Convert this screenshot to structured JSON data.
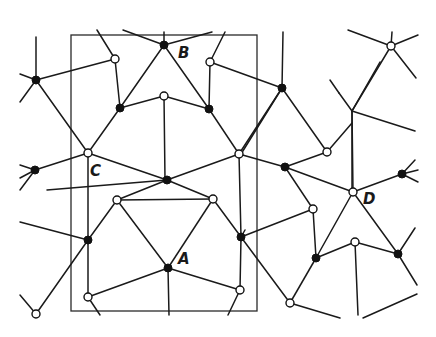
{
  "diagram": {
    "type": "crystal-lattice-network",
    "background": "#ffffff",
    "stroke_color": "#1a1a1a",
    "frame": {
      "x": 71,
      "y": 35,
      "width": 186,
      "height": 276
    },
    "labels": [
      {
        "id": "A",
        "text": "A",
        "x": 178,
        "y": 264
      },
      {
        "id": "B",
        "text": "B",
        "x": 178,
        "y": 58
      },
      {
        "id": "C",
        "text": "C",
        "x": 90,
        "y": 176
      },
      {
        "id": "D",
        "text": "D",
        "x": 363,
        "y": 204
      }
    ],
    "nodes_filled": [
      [
        36,
        80
      ],
      [
        164,
        45
      ],
      [
        120,
        108
      ],
      [
        209,
        109
      ],
      [
        282,
        88
      ],
      [
        35,
        170
      ],
      [
        167,
        180
      ],
      [
        285,
        167
      ],
      [
        402,
        174
      ],
      [
        88,
        240
      ],
      [
        241,
        237
      ],
      [
        168,
        268
      ],
      [
        316,
        258
      ],
      [
        398,
        254
      ]
    ],
    "nodes_open": [
      [
        115,
        59
      ],
      [
        210,
        62
      ],
      [
        164,
        96
      ],
      [
        391,
        46
      ],
      [
        88,
        153
      ],
      [
        239,
        154
      ],
      [
        327,
        152
      ],
      [
        117,
        200
      ],
      [
        213,
        199
      ],
      [
        313,
        209
      ],
      [
        353,
        192
      ],
      [
        355,
        242
      ],
      [
        88,
        297
      ],
      [
        240,
        290
      ],
      [
        290,
        303
      ],
      [
        36,
        314
      ]
    ],
    "edges": [
      [
        36,
        80,
        115,
        59
      ],
      [
        36,
        80,
        36,
        37
      ],
      [
        36,
        80,
        20,
        74
      ],
      [
        36,
        80,
        20,
        102
      ],
      [
        36,
        80,
        88,
        153
      ],
      [
        115,
        59,
        97,
        30
      ],
      [
        115,
        59,
        120,
        108
      ],
      [
        164,
        45,
        123,
        30
      ],
      [
        164,
        45,
        212,
        32
      ],
      [
        164,
        45,
        164,
        32
      ],
      [
        164,
        45,
        120,
        108
      ],
      [
        164,
        45,
        209,
        109
      ],
      [
        120,
        108,
        164,
        96
      ],
      [
        164,
        96,
        209,
        109
      ],
      [
        120,
        108,
        88,
        153
      ],
      [
        210,
        62,
        225,
        32
      ],
      [
        210,
        62,
        209,
        109
      ],
      [
        210,
        62,
        282,
        88
      ],
      [
        209,
        109,
        239,
        154
      ],
      [
        282,
        88,
        283,
        32
      ],
      [
        282,
        88,
        327,
        152
      ],
      [
        282,
        88,
        241,
        154
      ],
      [
        282,
        88,
        239,
        154
      ],
      [
        327,
        152,
        352,
        123
      ],
      [
        327,
        152,
        285,
        167
      ],
      [
        391,
        46,
        348,
        30
      ],
      [
        391,
        46,
        392,
        32
      ],
      [
        391,
        46,
        418,
        35
      ],
      [
        391,
        46,
        416,
        78
      ],
      [
        391,
        46,
        352,
        111
      ],
      [
        352,
        111,
        380,
        62
      ],
      [
        352,
        111,
        352,
        192
      ],
      [
        352,
        111,
        415,
        131
      ],
      [
        352,
        111,
        339,
        93
      ],
      [
        339,
        93,
        330,
        80
      ],
      [
        88,
        153,
        35,
        170
      ],
      [
        35,
        170,
        20,
        165
      ],
      [
        35,
        170,
        20,
        178
      ],
      [
        35,
        170,
        20,
        190
      ],
      [
        88,
        153,
        167,
        180
      ],
      [
        88,
        153,
        88,
        240
      ],
      [
        164,
        96,
        165,
        180
      ],
      [
        167,
        180,
        239,
        154
      ],
      [
        167,
        180,
        213,
        199
      ],
      [
        167,
        180,
        117,
        200
      ],
      [
        167,
        180,
        47,
        190
      ],
      [
        239,
        154,
        285,
        167
      ],
      [
        239,
        154,
        241,
        237
      ],
      [
        285,
        167,
        353,
        192
      ],
      [
        285,
        167,
        313,
        209
      ],
      [
        353,
        192,
        402,
        174
      ],
      [
        353,
        192,
        352,
        111
      ],
      [
        353,
        192,
        316,
        258
      ],
      [
        353,
        192,
        398,
        254
      ],
      [
        402,
        174,
        415,
        160
      ],
      [
        402,
        174,
        418,
        170
      ],
      [
        402,
        174,
        418,
        182
      ],
      [
        117,
        200,
        213,
        199
      ],
      [
        117,
        200,
        88,
        240
      ],
      [
        117,
        200,
        168,
        268
      ],
      [
        213,
        199,
        168,
        268
      ],
      [
        213,
        199,
        241,
        237
      ],
      [
        313,
        209,
        241,
        237
      ],
      [
        313,
        209,
        316,
        258
      ],
      [
        355,
        242,
        316,
        258
      ],
      [
        355,
        242,
        398,
        254
      ],
      [
        355,
        242,
        358,
        315
      ],
      [
        398,
        254,
        415,
        228
      ],
      [
        398,
        254,
        417,
        285
      ],
      [
        20,
        222,
        88,
        240
      ],
      [
        88,
        240,
        88,
        297
      ],
      [
        88,
        240,
        36,
        314
      ],
      [
        36,
        314,
        20,
        295
      ],
      [
        241,
        237,
        240,
        290
      ],
      [
        241,
        237,
        290,
        303
      ],
      [
        241,
        237,
        245,
        230
      ],
      [
        168,
        268,
        88,
        297
      ],
      [
        168,
        268,
        240,
        290
      ],
      [
        168,
        268,
        169,
        315
      ],
      [
        88,
        297,
        100,
        315
      ],
      [
        240,
        290,
        228,
        315
      ],
      [
        316,
        258,
        290,
        303
      ],
      [
        290,
        303,
        340,
        318
      ],
      [
        363,
        318,
        417,
        294
      ]
    ]
  }
}
